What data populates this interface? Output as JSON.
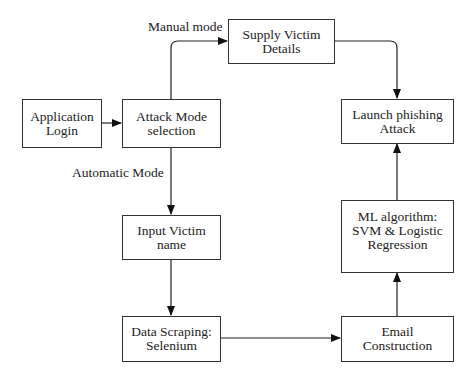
{
  "diagram": {
    "type": "flowchart",
    "nodes": [
      {
        "id": "app_login",
        "label": "Application\nLogin"
      },
      {
        "id": "attack_mode",
        "label": "Attack Mode\nselection"
      },
      {
        "id": "supply_victim",
        "label": "Supply Victim\nDetails"
      },
      {
        "id": "launch_attack",
        "label": "Launch phishing\nAttack"
      },
      {
        "id": "input_victim",
        "label": "Input Victim\nname"
      },
      {
        "id": "data_scraping",
        "label": "Data Scraping:\nSelenium"
      },
      {
        "id": "ml_algorithm",
        "label": "ML algorithm:\nSVM & Logistic\nRegression"
      },
      {
        "id": "email_construction",
        "label": "Email\nConstruction"
      }
    ],
    "edge_labels": {
      "manual": "Manual mode",
      "automatic": "Automatic Mode"
    },
    "edges": [
      {
        "from": "app_login",
        "to": "attack_mode",
        "label": ""
      },
      {
        "from": "attack_mode",
        "to": "supply_victim",
        "label": "Manual mode"
      },
      {
        "from": "supply_victim",
        "to": "launch_attack",
        "label": ""
      },
      {
        "from": "attack_mode",
        "to": "input_victim",
        "label": "Automatic Mode"
      },
      {
        "from": "input_victim",
        "to": "data_scraping",
        "label": ""
      },
      {
        "from": "data_scraping",
        "to": "email_construction",
        "label": ""
      },
      {
        "from": "email_construction",
        "to": "ml_algorithm",
        "label": ""
      },
      {
        "from": "ml_algorithm",
        "to": "launch_attack",
        "label": ""
      }
    ]
  }
}
